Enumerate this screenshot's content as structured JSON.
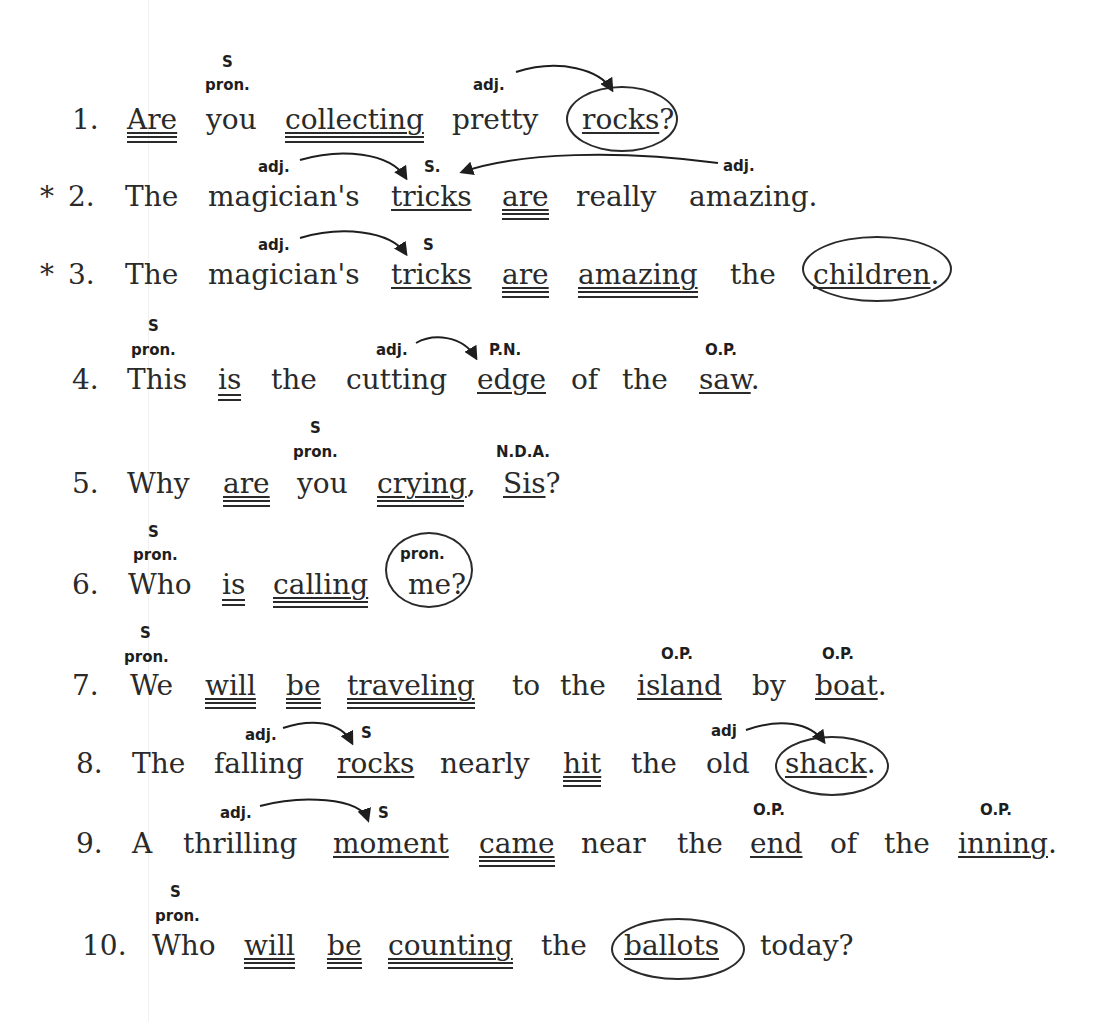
{
  "document": {
    "type": "grammar worksheet",
    "sentences": [
      {
        "number": "1.",
        "marker": "",
        "words": [
          "Are",
          "you",
          "collecting",
          "pretty",
          "rocks?"
        ],
        "labels": {
          "you": [
            "S",
            "pron."
          ],
          "pretty": [
            "adj."
          ]
        }
      },
      {
        "number": "2.",
        "marker": "*",
        "words": [
          "The",
          "magician's",
          "tricks",
          "are",
          "really",
          "amazing."
        ],
        "labels": {
          "magician's": [
            "adj."
          ],
          "tricks": [
            "S."
          ],
          "amazing": [
            "adj."
          ]
        }
      },
      {
        "number": "3.",
        "marker": "*",
        "words": [
          "The",
          "magician's",
          "tricks",
          "are",
          "amazing",
          "the",
          "children."
        ],
        "labels": {
          "magician's": [
            "adj."
          ],
          "tricks": [
            "S"
          ]
        }
      },
      {
        "number": "4.",
        "marker": "",
        "words": [
          "This",
          "is",
          "the",
          "cutting",
          "edge",
          "of",
          "the",
          "saw."
        ],
        "labels": {
          "This": [
            "S",
            "pron."
          ],
          "cutting": [
            "adj."
          ],
          "edge": [
            "P.N."
          ],
          "saw": [
            "O.P."
          ]
        }
      },
      {
        "number": "5.",
        "marker": "",
        "words": [
          "Why",
          "are",
          "you",
          "crying,",
          "Sis?"
        ],
        "labels": {
          "you": [
            "S",
            "pron."
          ],
          "Sis": [
            "N.D.A."
          ]
        }
      },
      {
        "number": "6.",
        "marker": "",
        "words": [
          "Who",
          "is",
          "calling",
          "me?"
        ],
        "labels": {
          "Who": [
            "S",
            "pron."
          ],
          "me": [
            "pron."
          ]
        }
      },
      {
        "number": "7.",
        "marker": "",
        "words": [
          "We",
          "will",
          "be",
          "traveling",
          "to",
          "the",
          "island",
          "by",
          "boat."
        ],
        "labels": {
          "We": [
            "S",
            "pron."
          ],
          "island": [
            "O.P."
          ],
          "boat": [
            "O.P."
          ]
        }
      },
      {
        "number": "8.",
        "marker": "",
        "words": [
          "The",
          "falling",
          "rocks",
          "nearly",
          "hit",
          "the",
          "old",
          "shack."
        ],
        "labels": {
          "falling": [
            "adj."
          ],
          "rocks": [
            "S"
          ],
          "old": [
            "adj"
          ]
        }
      },
      {
        "number": "9.",
        "marker": "",
        "words": [
          "A",
          "thrilling",
          "moment",
          "came",
          "near",
          "the",
          "end",
          "of",
          "the",
          "inning."
        ],
        "labels": {
          "thrilling": [
            "adj."
          ],
          "moment": [
            "S"
          ],
          "end": [
            "O.P."
          ],
          "inning": [
            "O.P."
          ]
        }
      },
      {
        "number": "10.",
        "marker": "",
        "words": [
          "Who",
          "will",
          "be",
          "counting",
          "the",
          "ballots",
          "today?"
        ],
        "labels": {
          "Who": [
            "S",
            "pron."
          ]
        }
      }
    ]
  },
  "text": {
    "s1": {
      "num": "1.",
      "w1": "Are",
      "w2": "you",
      "w3": "collecting",
      "w4": "pretty",
      "w5a": "rocks",
      "w5b": "?",
      "l_s": "S",
      "l_pron": "pron.",
      "l_adj": "adj."
    },
    "s2": {
      "star": "*",
      "num": "2.",
      "w1": "The",
      "w2": "magician's",
      "w3": "tricks",
      "w4": "are",
      "w5": "really",
      "w6": "amazing.",
      "l_adj1": "adj.",
      "l_s": "S.",
      "l_adj2": "adj."
    },
    "s3": {
      "star": "*",
      "num": "3.",
      "w1": "The",
      "w2": "magician's",
      "w3": "tricks",
      "w4": "are",
      "w5": "amazing",
      "w6": "the",
      "w7a": "children",
      "w7b": ".",
      "l_adj": "adj.",
      "l_s": "S"
    },
    "s4": {
      "num": "4.",
      "w1": "This",
      "w2": "is",
      "w3": "the",
      "w4": "cutting",
      "w5": "edge",
      "w6": "of",
      "w7": "the",
      "w8a": "saw",
      "w8b": ".",
      "l_s": "S",
      "l_pron": "pron.",
      "l_adj": "adj.",
      "l_pn": "P.N.",
      "l_op": "O.P."
    },
    "s5": {
      "num": "5.",
      "w1": "Why",
      "w2": "are",
      "w3": "you",
      "w4a": "crying",
      ",": ",",
      "w4b": ",",
      "w5a": "Sis",
      "w5b": "?",
      "l_s": "S",
      "l_pron": "pron.",
      "l_nda": "N.D.A."
    },
    "s6": {
      "num": "6.",
      "w1": "Who",
      "w2": "is",
      "w3": "calling",
      "w4": "me?",
      "l_s": "S",
      "l_pron": "pron.",
      "l_pron2": "pron."
    },
    "s7": {
      "num": "7.",
      "w1": "We",
      "w2": "will",
      "w3": "be",
      "w4": "traveling",
      "w5": "to",
      "w6": "the",
      "w7": "island",
      "w8": "by",
      "w9a": "boat",
      "w9b": ".",
      "l_s": "S",
      "l_pron": "pron.",
      "l_op1": "O.P.",
      "l_op2": "O.P."
    },
    "s8": {
      "num": "8.",
      "w1": "The",
      "w2": "falling",
      "w3": "rocks",
      "w4": "nearly",
      "w5": "hit",
      "w6": "the",
      "w7": "old",
      "w8a": "shack",
      "w8b": ".",
      "l_adj": "adj.",
      "l_s": "S",
      "l_adj2": "adj"
    },
    "s9": {
      "num": "9.",
      "w1": "A",
      "w2": "thrilling",
      "w3": "moment",
      "w4": "came",
      "w5": "near",
      "w6": "the",
      "w7": "end",
      "w8": "of",
      "w9": "the",
      "w10a": "inning",
      "w10b": ".",
      "l_adj": "adj.",
      "l_s": "S",
      "l_op1": "O.P.",
      "l_op2": "O.P."
    },
    "s10": {
      "num": "10.",
      "w1": "Who",
      "w2": "will",
      "w3": "be",
      "w4": "counting",
      "w5": "the",
      "w6": "ballots",
      "w7": "today?",
      "l_s": "S",
      "l_pron": "pron."
    }
  },
  "colors": {
    "ink": "#2a2a2a",
    "paper": "#ffffff"
  }
}
